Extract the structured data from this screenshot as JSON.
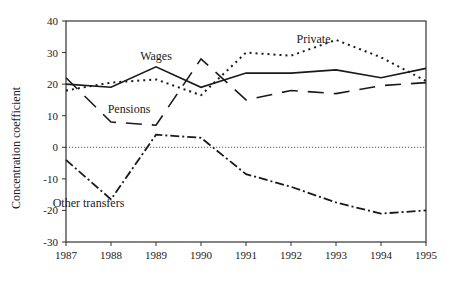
{
  "chart_data": {
    "type": "line",
    "title": "",
    "xlabel": "",
    "ylabel": "Concentration coefficient",
    "x": [
      1987,
      1988,
      1989,
      1990,
      1991,
      1992,
      1993,
      1994,
      1995
    ],
    "ylim": [
      -30,
      40
    ],
    "yticks": [
      40,
      30,
      20,
      10,
      0,
      -10,
      -20,
      -30
    ],
    "xticks": [
      "1987",
      "1988",
      "1989",
      "1990",
      "1991",
      "1992",
      "1993",
      "1994",
      "1995"
    ],
    "grid": false,
    "reference_line": {
      "y": 0,
      "style": "dotted"
    },
    "legend": "inline labels",
    "series": [
      {
        "name": "Wages",
        "style": "solid",
        "values": [
          20,
          19,
          25.5,
          19,
          23.5,
          23.5,
          24.5,
          22,
          25
        ]
      },
      {
        "name": "Private",
        "style": "dotted",
        "values": [
          18,
          20.5,
          21.5,
          16.5,
          30,
          29,
          34,
          28.5,
          21
        ]
      },
      {
        "name": "Pensions",
        "style": "long-dash",
        "values": [
          22,
          8,
          7,
          28,
          15,
          18,
          17,
          19.5,
          20.5
        ]
      },
      {
        "name": "Other transfers",
        "style": "dash-dot",
        "values": [
          -4,
          -16.5,
          4,
          3,
          -8.5,
          -12.5,
          -17.5,
          -21,
          -20
        ]
      }
    ],
    "annotations": [
      {
        "text": "Wages",
        "x": 1989,
        "y": 27.5
      },
      {
        "text": "Private",
        "x": 1992.5,
        "y": 33
      },
      {
        "text": "Pensions",
        "x": 1988.4,
        "y": 11
      },
      {
        "text": "Other transfers",
        "x": 1987.5,
        "y": -19
      }
    ]
  }
}
